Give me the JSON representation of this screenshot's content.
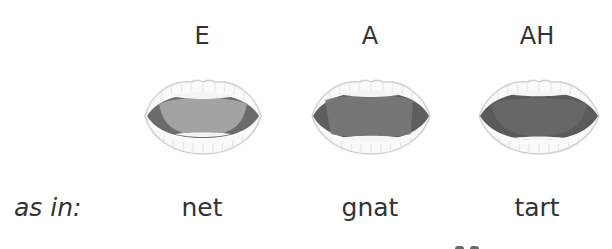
{
  "vowels": [
    {
      "label": "E",
      "example": "net",
      "center_x": 202,
      "tongue_color": "#a3a3a3",
      "shade_color": "#6b6b6b"
    },
    {
      "label": "A",
      "example": "gnat",
      "center_x": 370,
      "tongue_color": "#7a7a7a",
      "shade_color": "#5e5e5e"
    },
    {
      "label": "AH",
      "example": "tart",
      "center_x": 537,
      "tongue_color": "#6a6a6a",
      "shade_color": "#5a5a5a"
    }
  ],
  "row_label": "as in:",
  "colors": {
    "text": "#333333",
    "lip_outline": "#cfcfcf",
    "teeth": "#f4f4f4"
  }
}
